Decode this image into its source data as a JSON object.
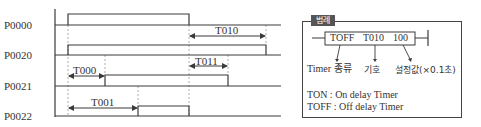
{
  "diagram": {
    "signals": [
      {
        "label": "P0000"
      },
      {
        "label": "P0020"
      },
      {
        "label": "P0021"
      },
      {
        "label": "P0022"
      }
    ],
    "timers": [
      {
        "label": "T010"
      },
      {
        "label": "T000"
      },
      {
        "label": "T011"
      },
      {
        "label": "T001"
      }
    ]
  },
  "legend": {
    "tag": "범례",
    "instruction": {
      "type": "TOFF",
      "symbol": "T010",
      "setting": "100"
    },
    "caption_type": "Timer 종류",
    "caption_symbol": "기호",
    "caption_setting": "설정값(×0.1초)",
    "definitions": [
      {
        "text": "TON : On delay Timer"
      },
      {
        "text": "TOFF : Off delay Timer"
      }
    ]
  },
  "colors": {
    "line": "#3a3a3a",
    "dashed": "#888888",
    "tag_bg": "#555555"
  }
}
